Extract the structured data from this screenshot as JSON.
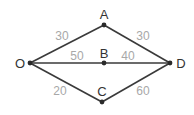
{
  "diagram": {
    "type": "weighted-graph",
    "nodes": [
      {
        "id": "O",
        "label": "O",
        "x": 30,
        "y": 63,
        "lx": 20,
        "ly": 68
      },
      {
        "id": "A",
        "label": "A",
        "x": 104,
        "y": 25,
        "lx": 104,
        "ly": 19
      },
      {
        "id": "B",
        "label": "B",
        "x": 104,
        "y": 63,
        "lx": 104,
        "ly": 58
      },
      {
        "id": "C",
        "label": "C",
        "x": 102,
        "y": 102,
        "lx": 102,
        "ly": 96
      },
      {
        "id": "D",
        "label": "D",
        "x": 170,
        "y": 63,
        "lx": 181,
        "ly": 68
      }
    ],
    "edges": [
      {
        "from": "O",
        "to": "A",
        "weight": "30",
        "wx": 62,
        "wy": 40
      },
      {
        "from": "A",
        "to": "D",
        "weight": "30",
        "wx": 143,
        "wy": 40
      },
      {
        "from": "O",
        "to": "B",
        "weight": "50",
        "wx": 77,
        "wy": 60
      },
      {
        "from": "B",
        "to": "D",
        "weight": "40",
        "wx": 128,
        "wy": 60
      },
      {
        "from": "O",
        "to": "C",
        "weight": "20",
        "wx": 60,
        "wy": 95
      },
      {
        "from": "C",
        "to": "D",
        "weight": "60",
        "wx": 143,
        "wy": 95
      }
    ]
  }
}
